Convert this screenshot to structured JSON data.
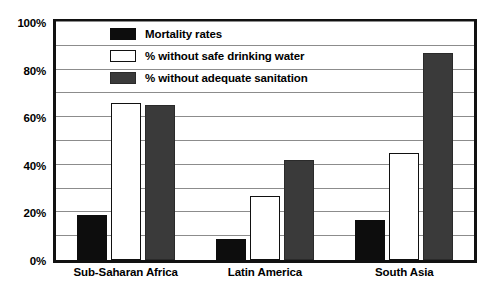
{
  "chart_data": {
    "type": "bar",
    "title": "",
    "xlabel": "",
    "ylabel": "",
    "ylim": [
      0,
      100
    ],
    "ytick_labels": [
      "100%",
      "80%",
      "60%",
      "40%",
      "20%",
      "0%"
    ],
    "ytick_values": [
      100,
      80,
      60,
      40,
      20,
      0
    ],
    "gridlines": true,
    "minor_gridline_step": 10,
    "legend_position": "top-center",
    "categories": [
      "Sub-Saharan Africa",
      "Latin America",
      "South Asia"
    ],
    "series": [
      {
        "name": "Mortality rates",
        "color": "#0d0d0d",
        "values": [
          19,
          9,
          17
        ]
      },
      {
        "name": "% without safe drinking water",
        "color": "#ffffff",
        "values": [
          66,
          27,
          45
        ]
      },
      {
        "name": "% without adequate sanitation",
        "color": "#3a3a3a",
        "values": [
          65,
          42,
          87
        ]
      }
    ]
  },
  "legend": {
    "items": [
      {
        "label": "Mortality rates",
        "swatch": "legend-swatch-black"
      },
      {
        "label": "% without safe drinking water",
        "swatch": "legend-swatch-white"
      },
      {
        "label": "% without adequate sanitation",
        "swatch": "legend-swatch-gray"
      }
    ]
  },
  "colors": {
    "series_black": "#0d0d0d",
    "series_white": "#ffffff",
    "series_gray": "#3a3a3a",
    "axis": "#111111",
    "gridline": "#8c8c8c",
    "background": "#ffffff"
  }
}
